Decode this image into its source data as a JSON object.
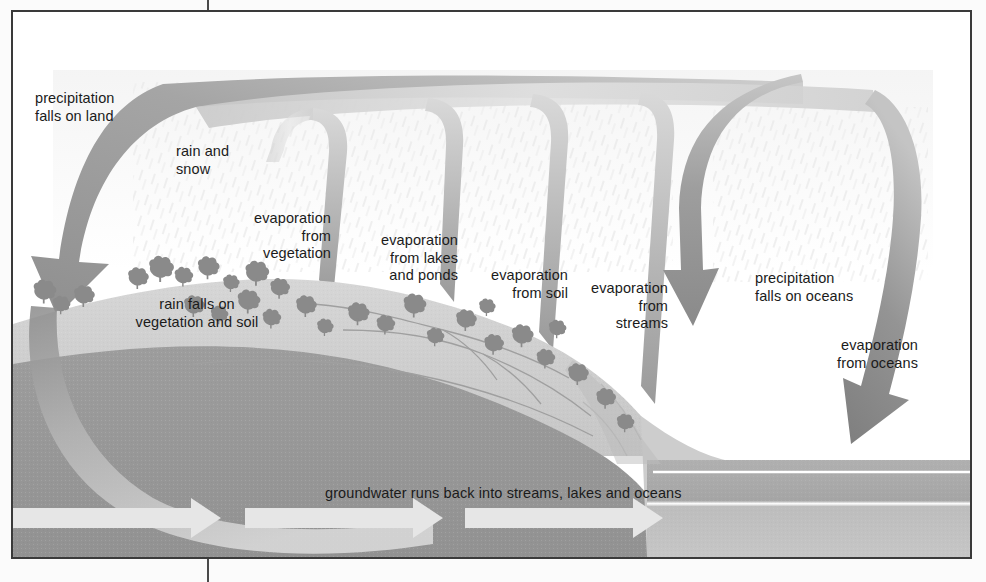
{
  "diagram": {
    "frame": {
      "border_color": "#3a3a3a",
      "background": "#ffffff"
    },
    "palette": {
      "sky": "#ffffff",
      "rain_streak": "#ededed",
      "land_surface": "#d2d2d2",
      "land_shadow": "#c2c2c2",
      "underground": "#9a9a9a",
      "ocean_upper": "#adadad",
      "ocean_lower": "#bcbcbc",
      "arrow_dark": "#8c8c8c",
      "arrow_mid": "#a8a8a8",
      "arrow_light": "#d8d8d8",
      "tree": "#8a8a8a",
      "groundwater_arrow": "#e4e4e4",
      "text": "#1b1b1b"
    },
    "labels": [
      {
        "id": "precipitation-falls-on-land",
        "text": "precipitation\nfalls on land",
        "align": "left",
        "x": 22,
        "y": 78
      },
      {
        "id": "rain-and-snow",
        "text": "rain and\nsnow",
        "align": "left",
        "x": 163,
        "y": 131
      },
      {
        "id": "evaporation-from-vegetation",
        "text": "evaporation\nfrom\nvegetation",
        "align": "right",
        "x": 163,
        "y": 198,
        "w": 155
      },
      {
        "id": "evaporation-from-lakes-and-ponds",
        "text": "evaporation\nfrom lakes\nand ponds",
        "align": "right",
        "x": 280,
        "y": 220,
        "w": 165
      },
      {
        "id": "rain-falls-on-vegetation-and-soil",
        "text": "rain falls on\nvegetation and soil",
        "align": "center",
        "x": 94,
        "y": 284,
        "w": 180
      },
      {
        "id": "evaporation-from-soil",
        "text": "evaporation\nfrom soil",
        "align": "right",
        "x": 395,
        "y": 255,
        "w": 160
      },
      {
        "id": "evaporation-from-streams",
        "text": "evaporation\nfrom\nstreams",
        "align": "right",
        "x": 500,
        "y": 268,
        "w": 155
      },
      {
        "id": "precipitation-falls-on-oceans",
        "text": "precipitation\nfalls on oceans",
        "align": "left",
        "x": 742,
        "y": 258
      },
      {
        "id": "evaporation-from-oceans",
        "text": "evaporation\nfrom oceans",
        "align": "right",
        "x": 720,
        "y": 325,
        "w": 185
      },
      {
        "id": "groundwater-runs-back",
        "text": "groundwater runs back into streams, lakes and oceans",
        "align": "left",
        "x": 312,
        "y": 473
      }
    ],
    "flows": [
      {
        "id": "precipitation-land-arch",
        "kind": "arch",
        "direction": "down-left",
        "label_ref": "precipitation-falls-on-land"
      },
      {
        "id": "evaporation-vegetation-arch",
        "kind": "arch",
        "direction": "up",
        "label_ref": "evaporation-from-vegetation"
      },
      {
        "id": "evaporation-lakes-arch",
        "kind": "arch",
        "direction": "up",
        "label_ref": "evaporation-from-lakes-and-ponds"
      },
      {
        "id": "evaporation-soil-arch",
        "kind": "arch",
        "direction": "up",
        "label_ref": "evaporation-from-soil"
      },
      {
        "id": "evaporation-streams-arch",
        "kind": "arch",
        "direction": "up",
        "label_ref": "evaporation-from-streams"
      },
      {
        "id": "precipitation-oceans-arch",
        "kind": "arch",
        "direction": "down",
        "label_ref": "precipitation-falls-on-oceans"
      },
      {
        "id": "evaporation-oceans-arch",
        "kind": "arch",
        "direction": "up",
        "label_ref": "evaporation-from-oceans"
      },
      {
        "id": "groundwater-band",
        "kind": "band",
        "direction": "right",
        "label_ref": "groundwater-runs-back"
      },
      {
        "id": "groundwater-arrow-1",
        "kind": "arrow",
        "direction": "right"
      },
      {
        "id": "groundwater-arrow-2",
        "kind": "arrow",
        "direction": "right"
      },
      {
        "id": "groundwater-arrow-3",
        "kind": "arrow",
        "direction": "right"
      }
    ]
  }
}
